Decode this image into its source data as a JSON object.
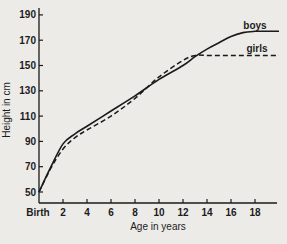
{
  "chart_data": {
    "type": "line",
    "title": "",
    "xlabel": "Age in years",
    "ylabel": "Height in cm",
    "x_tick_labels": [
      "Birth",
      "2",
      "4",
      "6",
      "8",
      "10",
      "12",
      "14",
      "16",
      "18"
    ],
    "x_ticks": [
      0,
      2,
      4,
      6,
      8,
      10,
      12,
      14,
      16,
      18
    ],
    "y_ticks": [
      50,
      70,
      90,
      110,
      130,
      150,
      170,
      190
    ],
    "xlim": [
      0,
      20
    ],
    "ylim": [
      50,
      195
    ],
    "grid": false,
    "legend_position": "inline-right",
    "x": [
      0,
      1,
      2,
      3,
      4,
      6,
      8,
      10,
      12,
      13,
      14,
      15,
      16,
      17,
      18,
      19,
      20
    ],
    "series": [
      {
        "name": "boys",
        "style": "solid",
        "values": [
          50,
          70,
          88,
          96,
          102,
          114,
          126,
          139,
          150,
          157,
          163,
          168,
          173,
          176,
          177,
          177,
          177
        ]
      },
      {
        "name": "girls",
        "style": "dashed",
        "values": [
          50,
          69,
          84,
          93,
          99,
          110,
          124,
          141,
          154,
          158,
          158,
          158,
          158,
          158,
          158,
          158,
          158
        ]
      }
    ],
    "annotations": [
      {
        "text": "boys",
        "near": "end of solid line"
      },
      {
        "text": "girls",
        "near": "end of dashed line"
      }
    ]
  },
  "labels": {
    "ylabel": "Height in cm",
    "xlabel": "Age in years",
    "boys": "boys",
    "girls": "girls"
  }
}
